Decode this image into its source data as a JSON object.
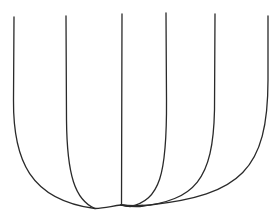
{
  "diagram": {
    "type": "curve-family",
    "width": 277,
    "height": 216,
    "stroke_color": "#2a2a2a",
    "background": "#ffffff",
    "curves": [
      {
        "id": "curve-1",
        "d": "M14,17 L13.5,100 C13,160 30,200 95,208.5"
      },
      {
        "id": "curve-2",
        "d": "M66,16 L66.5,120 C67,175 75,200 95,208.5 C105,208 112,206 121,205"
      },
      {
        "id": "curve-3",
        "d": "M122,14 L121.5,205 C128,206 136,206 143,205.5"
      },
      {
        "id": "curve-4",
        "d": "M166,13 L166.5,100 C167,175 160,200 130,206.5 C125,206 122,205.5 121,205"
      },
      {
        "id": "curve-5",
        "d": "M215,14 L214.5,110 C213,180 195,200 140,206.5 C132,207 126,206 121,205"
      },
      {
        "id": "curve-6",
        "d": "M268,16 L268,80 C268,170 240,195 150,205 C140,206 130,206 121,205"
      }
    ]
  }
}
